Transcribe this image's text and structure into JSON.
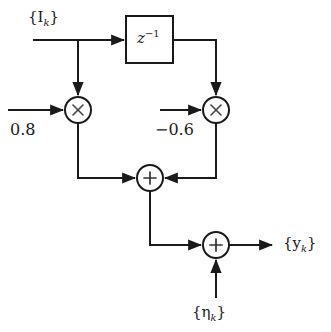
{
  "diagram": {
    "stroke_color": "#1a1a1a",
    "fill_color": "#ffffff",
    "labels": {
      "input_signal": "{I",
      "input_signal_sub": "k",
      "input_signal_close": "}",
      "output_signal": "{y",
      "output_signal_sub": "k",
      "output_signal_close": "}",
      "noise_signal": "{η",
      "noise_signal_sub": "k",
      "noise_signal_close": "}",
      "delay_block": "z",
      "delay_block_exponent": "−1",
      "coefficient_1": "0.8",
      "coefficient_2": "−0.6",
      "multiply_symbol": "×",
      "sum_symbol": "+"
    },
    "nodes": [
      {
        "name": "delay-block",
        "type": "rect",
        "x": 126,
        "y": 16,
        "w": 47,
        "h": 47
      },
      {
        "name": "multiplier-1",
        "type": "circle",
        "cx": 78,
        "cy": 110,
        "r": 13
      },
      {
        "name": "multiplier-2",
        "type": "circle",
        "cx": 216,
        "cy": 110,
        "r": 13
      },
      {
        "name": "adder-1",
        "type": "circle",
        "cx": 150,
        "cy": 178,
        "r": 13
      },
      {
        "name": "adder-2",
        "type": "circle",
        "cx": 216,
        "cy": 245,
        "r": 13
      }
    ]
  }
}
